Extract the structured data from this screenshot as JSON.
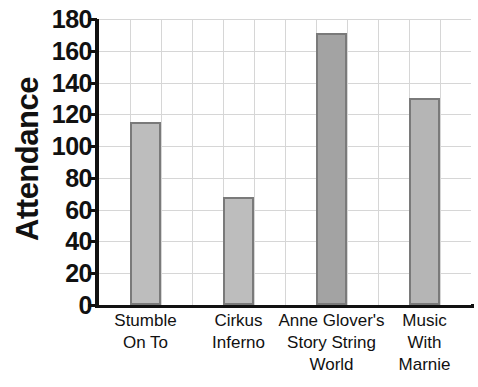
{
  "chart_data": {
    "type": "bar",
    "title": "",
    "subtitle": "",
    "xlabel": "",
    "ylabel": "Attendance",
    "categories": [
      "Stumble On To",
      "Cirkus Inferno",
      "Anne Glover's Story String World",
      "Music With Marnie"
    ],
    "category_lines": [
      [
        "Stumble",
        "On To"
      ],
      [
        "Cirkus",
        "Inferno"
      ],
      [
        "Anne Glover's",
        "Story String",
        "World"
      ],
      [
        "Music",
        "With",
        "Marnie"
      ]
    ],
    "values": [
      115,
      68,
      171,
      130
    ],
    "ylim": [
      0,
      180
    ],
    "y_ticks": [
      0,
      20,
      40,
      60,
      80,
      100,
      120,
      140,
      160,
      180
    ],
    "y_tick_labels": [
      "0",
      "20",
      "40",
      "60",
      "80",
      "100",
      "120",
      "140",
      "160",
      "180"
    ],
    "grid": {
      "horizontal": true,
      "vertical": true,
      "color": "#d6d6d6",
      "vertical_count": 12
    },
    "legend": {
      "visible": false,
      "position": "none",
      "entries": []
    },
    "bar_colors": [
      "#bdbdbd",
      "#bdbdbd",
      "#a3a3a3",
      "#b5b5b5"
    ],
    "bar_edge_color": "#7a7a7a",
    "axis_color": "#111111",
    "background_color": "#ffffff"
  }
}
